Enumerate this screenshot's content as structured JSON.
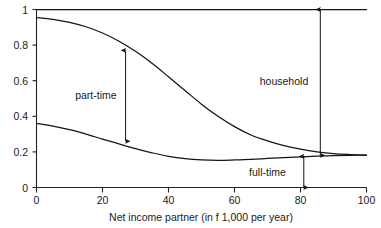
{
  "chart_data": {
    "type": "line",
    "title": "",
    "xlabel": "Net income partner (in f 1,000 per year)",
    "ylabel": "",
    "xlim": [
      0,
      100
    ],
    "ylim": [
      0,
      1
    ],
    "grid": false,
    "legend_position": "none",
    "xticks": [
      "0",
      "20",
      "40",
      "60",
      "80",
      "100"
    ],
    "xtick_values": [
      0,
      20,
      40,
      60,
      80,
      100
    ],
    "yticks": [
      "0",
      "0.2",
      "0.4",
      "0.6",
      "0.8",
      "1"
    ],
    "ytick_values": [
      0,
      0.2,
      0.4,
      0.6,
      0.8,
      1
    ],
    "x": [
      0,
      5,
      10,
      15,
      20,
      25,
      30,
      35,
      40,
      45,
      50,
      55,
      60,
      65,
      70,
      75,
      80,
      85,
      90,
      95,
      100
    ],
    "series": [
      {
        "name": "household",
        "values": [
          1,
          1,
          1,
          1,
          1,
          1,
          1,
          1,
          1,
          1,
          1,
          1,
          1,
          1,
          1,
          1,
          1,
          1,
          1,
          1,
          1
        ]
      },
      {
        "name": "part-time upper boundary",
        "values": [
          0.955,
          0.945,
          0.928,
          0.903,
          0.868,
          0.822,
          0.765,
          0.698,
          0.622,
          0.545,
          0.468,
          0.4,
          0.342,
          0.295,
          0.262,
          0.235,
          0.215,
          0.2,
          0.19,
          0.185,
          0.182
        ]
      },
      {
        "name": "full-time upper boundary",
        "values": [
          0.36,
          0.345,
          0.325,
          0.3,
          0.272,
          0.245,
          0.218,
          0.195,
          0.175,
          0.162,
          0.155,
          0.153,
          0.155,
          0.158,
          0.163,
          0.168,
          0.172,
          0.176,
          0.179,
          0.181,
          0.182
        ]
      }
    ],
    "annotations": [
      {
        "label": "part-time",
        "kind": "double-arrow",
        "x": 27,
        "y_from": 0.26,
        "y_to": 0.77,
        "text_x": 18,
        "text_y": 0.52
      },
      {
        "label": "household",
        "kind": "double-arrow",
        "x": 86,
        "y_from": 0.18,
        "y_to": 1.0,
        "text_x": 75,
        "text_y": 0.6
      },
      {
        "label": "full-time",
        "kind": "double-arrow",
        "x": 81,
        "y_from": 0.0,
        "y_to": 0.175,
        "text_x": 70,
        "text_y": 0.085
      }
    ]
  },
  "colors": {
    "background": "#ffffff",
    "axis": "#222222",
    "curve": "#141414",
    "annotation": "#141414",
    "text": "#1a1a1a"
  }
}
